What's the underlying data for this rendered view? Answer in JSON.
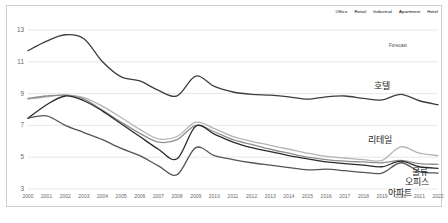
{
  "chart_data": {
    "type": "line",
    "title": "",
    "xlabel": "",
    "ylabel": "",
    "ylim": [
      3,
      13
    ],
    "xlim": [
      2000,
      2022
    ],
    "grid": true,
    "grid_axis": "y",
    "legend_position": "top-right",
    "yticks": [
      3,
      5,
      7,
      9,
      11,
      13
    ],
    "categories": [
      "2000",
      "2001",
      "2002",
      "2003",
      "2004",
      "2005",
      "2006",
      "2007",
      "2008",
      "2009",
      "2010",
      "2011",
      "2012",
      "2013",
      "2014",
      "2015",
      "2016",
      "2017",
      "2018",
      "2019",
      "2020",
      "2021",
      "2022"
    ],
    "annotations": [
      {
        "text": "Forecast",
        "x": 2021.3,
        "y": 11.9
      }
    ],
    "series": [
      {
        "name": "Hotel",
        "label_ko": "호텔",
        "color": "#3c3c3c",
        "values": [
          11.7,
          12.3,
          12.7,
          12.45,
          11.0,
          10.05,
          9.8,
          9.2,
          8.85,
          10.1,
          9.45,
          9.1,
          8.95,
          8.9,
          8.8,
          8.65,
          8.8,
          8.85,
          8.7,
          8.6,
          8.95,
          8.55,
          8.3
        ]
      },
      {
        "name": "Retail",
        "label_ko": "리테일",
        "color": "#b4b4b4",
        "values": [
          8.65,
          8.8,
          8.9,
          8.75,
          8.2,
          7.5,
          6.75,
          6.15,
          6.3,
          7.2,
          6.8,
          6.3,
          6.0,
          5.75,
          5.5,
          5.25,
          5.05,
          4.95,
          4.85,
          4.8,
          5.65,
          5.25,
          5.1
        ]
      },
      {
        "name": "Industrial",
        "label_ko": "물류",
        "color": "#8e8e8e",
        "values": [
          8.7,
          8.85,
          8.9,
          8.65,
          7.95,
          7.2,
          6.5,
          5.95,
          6.1,
          7.0,
          6.6,
          6.1,
          5.8,
          5.5,
          5.25,
          5.0,
          4.85,
          4.75,
          4.7,
          4.65,
          4.8,
          4.6,
          4.55
        ]
      },
      {
        "name": "Office",
        "label_ko": "오피스",
        "color": "#2a2a2a",
        "values": [
          7.45,
          8.3,
          8.85,
          8.55,
          7.9,
          7.1,
          6.3,
          5.5,
          4.9,
          6.95,
          6.45,
          5.95,
          5.6,
          5.35,
          5.1,
          4.9,
          4.7,
          4.6,
          4.5,
          4.4,
          4.75,
          4.4,
          4.3
        ]
      },
      {
        "name": "Apartment",
        "label_ko": "아파트",
        "color": "#555555",
        "values": [
          7.45,
          7.6,
          7.0,
          6.55,
          6.1,
          5.55,
          5.1,
          4.45,
          3.9,
          5.6,
          5.1,
          4.85,
          4.65,
          4.5,
          4.35,
          4.2,
          4.25,
          4.15,
          4.05,
          4.0,
          4.65,
          4.1,
          4.0
        ]
      }
    ]
  },
  "legend": {
    "items": [
      {
        "label": "Office",
        "color": "#2a2a2a"
      },
      {
        "label": "Retail",
        "color": "#b4b4b4"
      },
      {
        "label": "Industrial",
        "color": "#c8c8c8"
      },
      {
        "label": "Apartment",
        "color": "#555555"
      },
      {
        "label": "Hotel",
        "color": "#3c3c3c"
      }
    ]
  },
  "series_labels": {
    "hotel": "호텔",
    "retail": "리테일",
    "industrial": "물류",
    "office": "오피스",
    "apartment": "아파트"
  },
  "forecast_label": "Forecast",
  "source_note": ""
}
